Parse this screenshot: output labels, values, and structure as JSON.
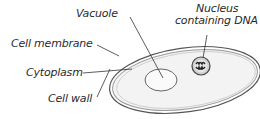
{
  "diagram": {
    "title": "",
    "type": "labeled-cell-diagram",
    "labels": {
      "vacuole": "Vacuole",
      "nucleus_line1": "Nucleus",
      "nucleus_line2": "containing DNA",
      "cell_membrane": "Cell membrane",
      "cytoplasm": "Cytoplasm",
      "cell_wall": "Cell wall"
    },
    "colors": {
      "outline": "#555555",
      "wall_inner": "#9a9a9a",
      "cytoplasm_fill": "#f3f3f3",
      "vacuole_fill": "#fafafa",
      "nucleus_fill": "#cfcfcf",
      "dna": "#222222",
      "text": "#2a2a2a"
    }
  }
}
